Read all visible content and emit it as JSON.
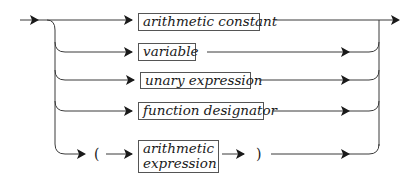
{
  "diagram": {
    "type": "syntax-diagram",
    "alternatives": [
      {
        "kind": "nonterminal",
        "label": "arithmetic constant"
      },
      {
        "kind": "nonterminal",
        "label": "variable"
      },
      {
        "kind": "nonterminal",
        "label": "unary expression"
      },
      {
        "kind": "nonterminal",
        "label": "function designator"
      },
      {
        "kind": "sequence",
        "open": "(",
        "label_line1": "arithmetic",
        "label_line2": "expression",
        "close": ")"
      }
    ],
    "colors": {
      "line": "#3a3a3a",
      "box_border": "#555555",
      "text": "#1a1a1a",
      "background": "#ffffff"
    }
  }
}
